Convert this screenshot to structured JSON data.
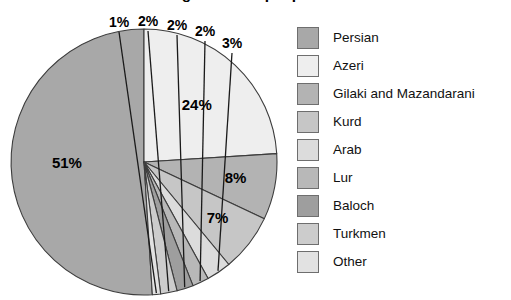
{
  "title": "What are the ethnic backgrounds of people in Iran?",
  "legend": {
    "items": [
      {
        "label": "Persian",
        "color": "#a8a8a8"
      },
      {
        "label": "Azeri",
        "color": "#eeeeee"
      },
      {
        "label": "Gilaki and Mazandarani",
        "color": "#b3b3b3"
      },
      {
        "label": "Kurd",
        "color": "#c6c6c6"
      },
      {
        "label": "Arab",
        "color": "#dcdcdc"
      },
      {
        "label": "Lur",
        "color": "#b8b8b8"
      },
      {
        "label": "Baloch",
        "color": "#9e9e9e"
      },
      {
        "label": "Turkmen",
        "color": "#cccccc"
      },
      {
        "label": "Other",
        "color": "#e2e2e2"
      }
    ]
  },
  "chart_data": {
    "type": "pie",
    "title": "What are the ethnic backgrounds of people in Iran?",
    "xlabel": "",
    "ylabel": "",
    "unit": "percent",
    "legend_position": "right",
    "grid": false,
    "start_angle_deg": 0,
    "direction": "clockwise",
    "total": 100,
    "categories": [
      "Persian",
      "Azeri",
      "Gilaki and Mazandarani",
      "Kurd",
      "Arab",
      "Lur",
      "Baloch",
      "Turkmen",
      "Other"
    ],
    "values": [
      51,
      24,
      8,
      7,
      3,
      2,
      2,
      2,
      1
    ],
    "slice_labels": [
      "51%",
      "24%",
      "8%",
      "7%",
      "3%",
      "2%",
      "2%",
      "2%",
      "1%"
    ],
    "colors": [
      "#a8a8a8",
      "#eeeeee",
      "#b3b3b3",
      "#c6c6c6",
      "#dcdcdc",
      "#b8b8b8",
      "#9e9e9e",
      "#cccccc",
      "#e2e2e2"
    ],
    "slices": [
      {
        "name": "Persian",
        "value": 51,
        "label": "51%",
        "color": "#a8a8a8",
        "label_placement": "inside"
      },
      {
        "name": "Azeri",
        "value": 24,
        "label": "24%",
        "color": "#eeeeee",
        "label_placement": "inside"
      },
      {
        "name": "Gilaki and Mazandarani",
        "value": 8,
        "label": "8%",
        "color": "#b3b3b3",
        "label_placement": "inside"
      },
      {
        "name": "Kurd",
        "value": 7,
        "label": "7%",
        "color": "#c6c6c6",
        "label_placement": "inside"
      },
      {
        "name": "Arab",
        "value": 3,
        "label": "3%",
        "color": "#dcdcdc",
        "label_placement": "outside"
      },
      {
        "name": "Lur",
        "value": 2,
        "label": "2%",
        "color": "#b8b8b8",
        "label_placement": "outside"
      },
      {
        "name": "Baloch",
        "value": 2,
        "label": "2%",
        "color": "#9e9e9e",
        "label_placement": "outside"
      },
      {
        "name": "Turkmen",
        "value": 2,
        "label": "2%",
        "color": "#cccccc",
        "label_placement": "outside"
      },
      {
        "name": "Other",
        "value": 1,
        "label": "1%",
        "color": "#e2e2e2",
        "label_placement": "outside"
      }
    ]
  },
  "geometry": {
    "center_x": 144,
    "center_y": 162,
    "radius": 133
  }
}
